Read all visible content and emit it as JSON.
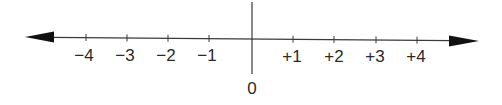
{
  "diagram": {
    "type": "number-line",
    "colors": {
      "line": "#3a3a3a",
      "text": "#2a2a2a",
      "background": "#ffffff"
    },
    "zero_label": "0",
    "ticks": [
      {
        "value": -4,
        "label": "−4"
      },
      {
        "value": -3,
        "label": "−3"
      },
      {
        "value": -2,
        "label": "−2"
      },
      {
        "value": -1,
        "label": "−1"
      },
      {
        "value": 1,
        "label": "+1"
      },
      {
        "value": 2,
        "label": "+2"
      },
      {
        "value": 3,
        "label": "+3"
      },
      {
        "value": 4,
        "label": "+4"
      }
    ],
    "arrows": [
      "left",
      "right"
    ]
  }
}
